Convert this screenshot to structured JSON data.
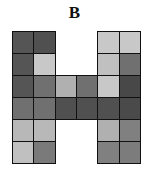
{
  "title": "B",
  "grid": {
    "cols": 6,
    "rows": 6,
    "cells": [
      {
        "r": 0,
        "c": 0,
        "color": "#555555"
      },
      {
        "r": 0,
        "c": 1,
        "color": "#505050"
      },
      {
        "r": 0,
        "c": 4,
        "color": "#c8c8c8"
      },
      {
        "r": 0,
        "c": 5,
        "color": "#c8c8c8"
      },
      {
        "r": 1,
        "c": 0,
        "color": "#555555"
      },
      {
        "r": 1,
        "c": 1,
        "color": "#c8c8c8"
      },
      {
        "r": 1,
        "c": 4,
        "color": "#c0c0c0"
      },
      {
        "r": 1,
        "c": 5,
        "color": "#707070"
      },
      {
        "r": 2,
        "c": 0,
        "color": "#555555"
      },
      {
        "r": 2,
        "c": 1,
        "color": "#707070"
      },
      {
        "r": 2,
        "c": 2,
        "color": "#b0b0b0"
      },
      {
        "r": 2,
        "c": 3,
        "color": "#707070"
      },
      {
        "r": 2,
        "c": 4,
        "color": "#c8c8c8"
      },
      {
        "r": 2,
        "c": 5,
        "color": "#484848"
      },
      {
        "r": 3,
        "c": 0,
        "color": "#707070"
      },
      {
        "r": 3,
        "c": 1,
        "color": "#707070"
      },
      {
        "r": 3,
        "c": 2,
        "color": "#505050"
      },
      {
        "r": 3,
        "c": 3,
        "color": "#505050"
      },
      {
        "r": 3,
        "c": 4,
        "color": "#505050"
      },
      {
        "r": 3,
        "c": 5,
        "color": "#4a4a4a"
      },
      {
        "r": 4,
        "c": 0,
        "color": "#b8b8b8"
      },
      {
        "r": 4,
        "c": 1,
        "color": "#b8b8b8"
      },
      {
        "r": 4,
        "c": 4,
        "color": "#b0b0b0"
      },
      {
        "r": 4,
        "c": 5,
        "color": "#808080"
      },
      {
        "r": 5,
        "c": 0,
        "color": "#c0c0c0"
      },
      {
        "r": 5,
        "c": 1,
        "color": "#7a7a7a"
      },
      {
        "r": 5,
        "c": 4,
        "color": "#808080"
      },
      {
        "r": 5,
        "c": 5,
        "color": "#7c7c7c"
      }
    ]
  }
}
